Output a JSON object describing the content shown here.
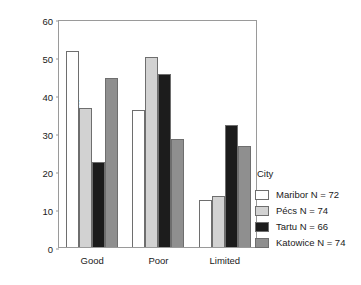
{
  "chart_data": {
    "type": "bar",
    "title": "",
    "subtitle": "",
    "xlabel": "",
    "ylabel": "Per cent",
    "ylim": [
      0,
      60
    ],
    "yticks": [
      0,
      10,
      20,
      30,
      40,
      50,
      60
    ],
    "ytick_labels": [
      "0",
      "10",
      "20",
      "30",
      "40",
      "50",
      "60"
    ],
    "grid": false,
    "legend_position": "right",
    "legend_title": "City",
    "categories": [
      "Good",
      "Poor",
      "Limited"
    ],
    "series": [
      {
        "name": "Maribor N = 72",
        "color": "#ffffff",
        "values": [
          51.5,
          36.0,
          12.5
        ]
      },
      {
        "name": "Pécs N = 74",
        "color": "#d2d2d2",
        "values": [
          36.5,
          50.0,
          13.5
        ]
      },
      {
        "name": "Tartu N = 66",
        "color": "#1c1c1c",
        "values": [
          22.5,
          45.5,
          32.0
        ]
      },
      {
        "name": "Katowice N = 74",
        "color": "#8f8f8f",
        "values": [
          44.5,
          28.5,
          26.5
        ]
      }
    ]
  },
  "axis": {
    "y_label": "Per cent",
    "y_ticks": [
      "60",
      "50",
      "40",
      "30",
      "20",
      "10",
      "0"
    ],
    "x_labels": [
      "Good",
      "Poor",
      "Limited"
    ]
  },
  "legend": {
    "title": "City",
    "items": [
      {
        "label": "Maribor N = 72",
        "color": "#ffffff"
      },
      {
        "label": "Pécs N = 74",
        "color": "#d2d2d2"
      },
      {
        "label": "Tartu N = 66",
        "color": "#1c1c1c"
      },
      {
        "label": "Katowice N = 74",
        "color": "#8f8f8f"
      }
    ]
  }
}
